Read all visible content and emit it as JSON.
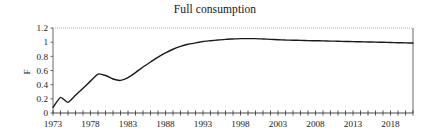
{
  "figure": {
    "title": "Full consumption",
    "background_color": "#ffffff"
  },
  "axes": {
    "y_axis_label": "F",
    "y_ticks": [
      "0",
      "0.2",
      "0.4",
      "0.6",
      "0.8",
      "1",
      "1.2"
    ],
    "x_ticks": [
      "1973",
      "1978",
      "1983",
      "1988",
      "1993",
      "1998",
      "2003",
      "2008",
      "2013",
      "2018"
    ]
  },
  "chart_data": {
    "type": "line",
    "title": "Full consumption",
    "xlabel": "",
    "ylabel": "F",
    "xlim": [
      1973,
      2021
    ],
    "ylim": [
      0,
      1.2
    ],
    "grid": false,
    "legend": null,
    "line_color": "#1a1a1a",
    "line_width": 1.4,
    "x_tick_labels": [
      "1973",
      "1978",
      "1983",
      "1988",
      "1993",
      "1998",
      "2003",
      "2008",
      "2013",
      "2018"
    ],
    "x_tick_step_major": 5,
    "x_tick_step_minor": 1,
    "y_tick_labels": [
      "0",
      "0.2",
      "0.4",
      "0.6",
      "0.8",
      "1",
      "1.2"
    ],
    "series": [
      {
        "name": "F",
        "x": [
          1973,
          1974,
          1975,
          1976,
          1977,
          1978,
          1979,
          1980,
          1981,
          1982,
          1983,
          1984,
          1985,
          1986,
          1987,
          1988,
          1989,
          1990,
          1991,
          1992,
          1993,
          1994,
          1995,
          1996,
          1997,
          1998,
          1999,
          2000,
          2001,
          2002,
          2003,
          2004,
          2005,
          2006,
          2007,
          2008,
          2009,
          2010,
          2011,
          2012,
          2013,
          2014,
          2015,
          2016,
          2017,
          2018,
          2019,
          2020,
          2021
        ],
        "values": [
          0.08,
          0.22,
          0.15,
          0.25,
          0.35,
          0.45,
          0.55,
          0.53,
          0.48,
          0.46,
          0.5,
          0.57,
          0.65,
          0.72,
          0.79,
          0.85,
          0.9,
          0.94,
          0.97,
          0.99,
          1.01,
          1.02,
          1.03,
          1.04,
          1.045,
          1.05,
          1.05,
          1.05,
          1.045,
          1.04,
          1.035,
          1.03,
          1.028,
          1.025,
          1.022,
          1.02,
          1.018,
          1.015,
          1.013,
          1.01,
          1.008,
          1.005,
          1.003,
          1.0,
          0.998,
          0.995,
          0.992,
          0.99,
          0.988
        ]
      }
    ]
  }
}
